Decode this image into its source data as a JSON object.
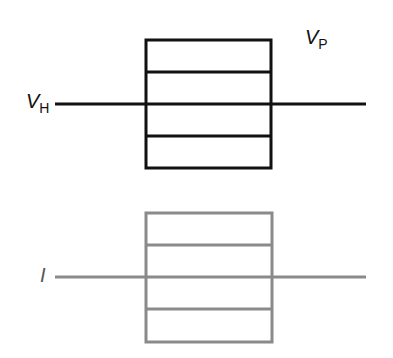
{
  "labels": {
    "vp": {
      "main": "V",
      "sub": "P"
    },
    "vh": {
      "main": "V",
      "sub": "H"
    },
    "i": {
      "main": "I"
    }
  },
  "colors": {
    "top": "#111111",
    "bottom": "#8a8a8a"
  },
  "top_diagram": {
    "box": {
      "x": 146,
      "y": 40,
      "w": 125,
      "h": 128
    },
    "dividers_y": [
      72,
      104,
      136
    ],
    "axis": {
      "x1": 55,
      "x2": 366,
      "y": 104
    }
  },
  "bottom_diagram": {
    "box": {
      "x": 146,
      "y": 213,
      "w": 126,
      "h": 129
    },
    "dividers_y": [
      245,
      277,
      309
    ],
    "axis": {
      "x1": 55,
      "x2": 366,
      "y": 277
    }
  }
}
